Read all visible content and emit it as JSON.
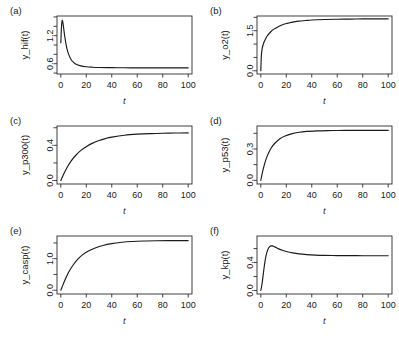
{
  "figure": {
    "background": "#ffffff",
    "foreground": "#1a1a1a",
    "rows": 3,
    "cols": 2
  },
  "chart_data": [
    {
      "type": "line",
      "panel": "(a)",
      "title": "",
      "xlabel": "t",
      "ylabel": "y_hif(t)",
      "xlim": [
        -3,
        103
      ],
      "ylim": [
        0.38,
        1.62
      ],
      "xticks": [
        0,
        20,
        40,
        60,
        80,
        100
      ],
      "xticklabels": [
        "0",
        "20",
        "40",
        "60",
        "80",
        "100"
      ],
      "yticks": [
        0.6,
        1.2
      ],
      "yticklabels": [
        "0.6",
        "1.2"
      ],
      "yminor": [
        0.4,
        0.8,
        1.0,
        1.4,
        1.6
      ],
      "grid": false,
      "legend": null,
      "x": [
        0,
        0.5,
        1,
        1.5,
        2,
        2.5,
        3,
        4,
        5,
        6,
        8,
        10,
        12,
        15,
        20,
        25,
        30,
        40,
        50,
        60,
        70,
        80,
        90,
        100
      ],
      "y": [
        1.05,
        1.38,
        1.52,
        1.5,
        1.41,
        1.3,
        1.2,
        1.03,
        0.9,
        0.81,
        0.69,
        0.63,
        0.59,
        0.56,
        0.535,
        0.525,
        0.52,
        0.515,
        0.513,
        0.512,
        0.512,
        0.512,
        0.512,
        0.512
      ]
    },
    {
      "type": "line",
      "panel": "(b)",
      "title": "",
      "xlabel": "t",
      "ylabel": "y_o2(t)",
      "xlim": [
        -3,
        103
      ],
      "ylim": [
        -0.12,
        2.05
      ],
      "xticks": [
        0,
        20,
        40,
        60,
        80,
        100
      ],
      "xticklabels": [
        "0",
        "20",
        "40",
        "60",
        "80",
        "100"
      ],
      "yticks": [
        0.0,
        1.5
      ],
      "yticklabels": [
        "0.0",
        "1.5"
      ],
      "yminor": [
        0.5,
        1.0,
        2.0
      ],
      "grid": false,
      "legend": null,
      "x": [
        0,
        0.4,
        1,
        2,
        3,
        5,
        8,
        10,
        14,
        18,
        22,
        26,
        30,
        35,
        40,
        50,
        60,
        70,
        80,
        90,
        100
      ],
      "y": [
        0.0,
        0.55,
        0.82,
        1.0,
        1.12,
        1.3,
        1.47,
        1.55,
        1.66,
        1.74,
        1.79,
        1.83,
        1.86,
        1.88,
        1.9,
        1.92,
        1.93,
        1.935,
        1.94,
        1.94,
        1.94
      ]
    },
    {
      "type": "line",
      "panel": "(c)",
      "title": "",
      "xlabel": "t",
      "ylabel": "y_p300(t)",
      "xlim": [
        -3,
        103
      ],
      "ylim": [
        -0.04,
        0.62
      ],
      "xticks": [
        0,
        20,
        40,
        60,
        80,
        100
      ],
      "xticklabels": [
        "0",
        "20",
        "40",
        "60",
        "80",
        "100"
      ],
      "yticks": [
        0.0,
        0.4
      ],
      "yticklabels": [
        "0.0",
        "0.4"
      ],
      "yminor": [
        0.2,
        0.6
      ],
      "grid": false,
      "legend": null,
      "x": [
        0,
        2,
        5,
        8,
        12,
        16,
        20,
        25,
        30,
        35,
        40,
        50,
        60,
        70,
        80,
        90,
        100
      ],
      "y": [
        0.0,
        0.065,
        0.15,
        0.22,
        0.29,
        0.345,
        0.385,
        0.425,
        0.455,
        0.477,
        0.493,
        0.515,
        0.527,
        0.534,
        0.538,
        0.54,
        0.541
      ]
    },
    {
      "type": "line",
      "panel": "(d)",
      "title": "",
      "xlabel": "t",
      "ylabel": "y_p53(t)",
      "xlim": [
        -3,
        103
      ],
      "ylim": [
        -0.035,
        0.52
      ],
      "xticks": [
        0,
        20,
        40,
        60,
        80,
        100
      ],
      "xticklabels": [
        "0",
        "20",
        "40",
        "60",
        "80",
        "100"
      ],
      "yticks": [
        0.0,
        0.3
      ],
      "yticklabels": [
        "0.0",
        "0.3"
      ],
      "yminor": [
        0.15,
        0.45
      ],
      "grid": false,
      "legend": null,
      "x": [
        0,
        1,
        3,
        5,
        8,
        11,
        15,
        19,
        24,
        30,
        36,
        44,
        52,
        60,
        70,
        80,
        90,
        100
      ],
      "y": [
        0.0,
        0.062,
        0.16,
        0.232,
        0.307,
        0.355,
        0.398,
        0.424,
        0.445,
        0.46,
        0.468,
        0.473,
        0.476,
        0.477,
        0.478,
        0.478,
        0.478,
        0.478
      ]
    },
    {
      "type": "line",
      "panel": "(e)",
      "title": "",
      "xlabel": "t",
      "ylabel": "y_casp(t)",
      "xlim": [
        -3,
        103
      ],
      "ylim": [
        -0.12,
        1.72
      ],
      "xticks": [
        0,
        20,
        40,
        60,
        80,
        100
      ],
      "xticklabels": [
        "0",
        "20",
        "40",
        "60",
        "80",
        "100"
      ],
      "yticks": [
        0.0,
        1.0
      ],
      "yticklabels": [
        "0.0",
        "1.0"
      ],
      "yminor": [
        0.5,
        1.5
      ],
      "grid": false,
      "legend": null,
      "x": [
        0,
        1,
        3,
        6,
        9,
        13,
        17,
        22,
        27,
        33,
        40,
        48,
        56,
        65,
        75,
        85,
        95,
        100
      ],
      "y": [
        0.0,
        0.1,
        0.3,
        0.56,
        0.76,
        0.97,
        1.12,
        1.25,
        1.34,
        1.42,
        1.48,
        1.52,
        1.545,
        1.56,
        1.568,
        1.572,
        1.574,
        1.575
      ]
    },
    {
      "type": "line",
      "panel": "(f)",
      "title": "",
      "xlabel": "t",
      "ylabel": "y_kp(t)",
      "xlim": [
        -3,
        103
      ],
      "ylim": [
        -0.05,
        0.78
      ],
      "xticks": [
        0,
        20,
        40,
        60,
        80,
        100
      ],
      "xticklabels": [
        "0",
        "20",
        "40",
        "60",
        "80",
        "100"
      ],
      "yticks": [
        0.0,
        0.4
      ],
      "yticklabels": [
        "0.0",
        "0.4"
      ],
      "yminor": [
        0.2,
        0.6
      ],
      "grid": false,
      "legend": null,
      "x": [
        0,
        1,
        2,
        3,
        4,
        5,
        6,
        7,
        8,
        9,
        10,
        12,
        14,
        17,
        20,
        25,
        30,
        36,
        43,
        50,
        60,
        70,
        80,
        90,
        100
      ],
      "y": [
        0.0,
        0.1,
        0.245,
        0.385,
        0.49,
        0.56,
        0.605,
        0.628,
        0.638,
        0.638,
        0.632,
        0.614,
        0.596,
        0.575,
        0.558,
        0.538,
        0.524,
        0.514,
        0.507,
        0.503,
        0.5,
        0.499,
        0.498,
        0.498,
        0.498
      ]
    }
  ]
}
